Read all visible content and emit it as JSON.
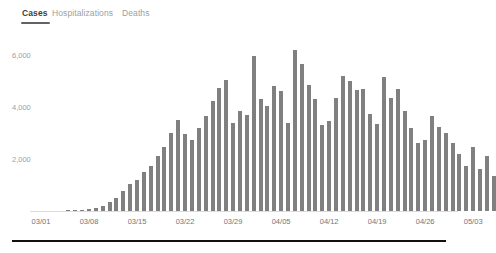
{
  "tabs": [
    {
      "label": "Cases",
      "active": true
    },
    {
      "label": "Hospitalizations",
      "active": false
    },
    {
      "label": "Deaths",
      "active": false
    }
  ],
  "colors": {
    "bar": "#808080",
    "tab_active_text": "#3c4043",
    "tab_inactive_text": "#9aa0a6",
    "tab_underline": "#5f6368",
    "axis_text": "#70757a",
    "axis_line": "#dadce0",
    "footer_rule": "#111111",
    "background": "#ffffff"
  },
  "chart_data": {
    "type": "bar",
    "title": "",
    "xlabel": "",
    "ylabel": "",
    "ylim": [
      0,
      6600
    ],
    "grid": false,
    "legend": null,
    "ytick_labels": [
      "2,000",
      "4,000",
      "6,000"
    ],
    "ytick_values": [
      2000,
      4000,
      6000
    ],
    "xtick_labels": [
      "03/01",
      "03/08",
      "03/15",
      "03/22",
      "03/29",
      "04/05",
      "04/12",
      "04/19",
      "04/26",
      "05/03"
    ],
    "xtick_indices": [
      0,
      7,
      14,
      21,
      28,
      35,
      42,
      49,
      56,
      63
    ],
    "categories": [
      "03/01",
      "03/02",
      "03/03",
      "03/04",
      "03/05",
      "03/06",
      "03/07",
      "03/08",
      "03/09",
      "03/10",
      "03/11",
      "03/12",
      "03/13",
      "03/14",
      "03/15",
      "03/16",
      "03/17",
      "03/18",
      "03/19",
      "03/20",
      "03/21",
      "03/22",
      "03/23",
      "03/24",
      "03/25",
      "03/26",
      "03/27",
      "03/28",
      "03/29",
      "03/30",
      "03/31",
      "04/01",
      "04/02",
      "04/03",
      "04/04",
      "04/05",
      "04/06",
      "04/07",
      "04/08",
      "04/09",
      "04/10",
      "04/11",
      "04/12",
      "04/13",
      "04/14",
      "04/15",
      "04/16",
      "04/17",
      "04/18",
      "04/19",
      "04/20",
      "04/21",
      "04/22",
      "04/23",
      "04/24",
      "04/25",
      "04/26",
      "04/27",
      "04/28",
      "04/29",
      "04/30",
      "05/01",
      "05/02",
      "05/03",
      "05/04",
      "05/05",
      "05/06"
    ],
    "values": [
      0,
      0,
      0,
      0,
      10,
      20,
      40,
      60,
      110,
      200,
      330,
      500,
      780,
      1050,
      1200,
      1500,
      1750,
      2100,
      2450,
      3000,
      3500,
      2950,
      2750,
      3200,
      3650,
      4250,
      4750,
      5050,
      3400,
      3850,
      3700,
      5950,
      4300,
      4050,
      4800,
      4600,
      3400,
      6200,
      5650,
      4850,
      4300,
      3300,
      3450,
      4350,
      5200,
      5000,
      4650,
      4700,
      3750,
      3350,
      5150,
      4350,
      4700,
      3850,
      3200,
      2600,
      2750,
      3650,
      3250,
      3000,
      2600,
      2200,
      1750,
      2450,
      1600,
      2100,
      1350
    ]
  }
}
